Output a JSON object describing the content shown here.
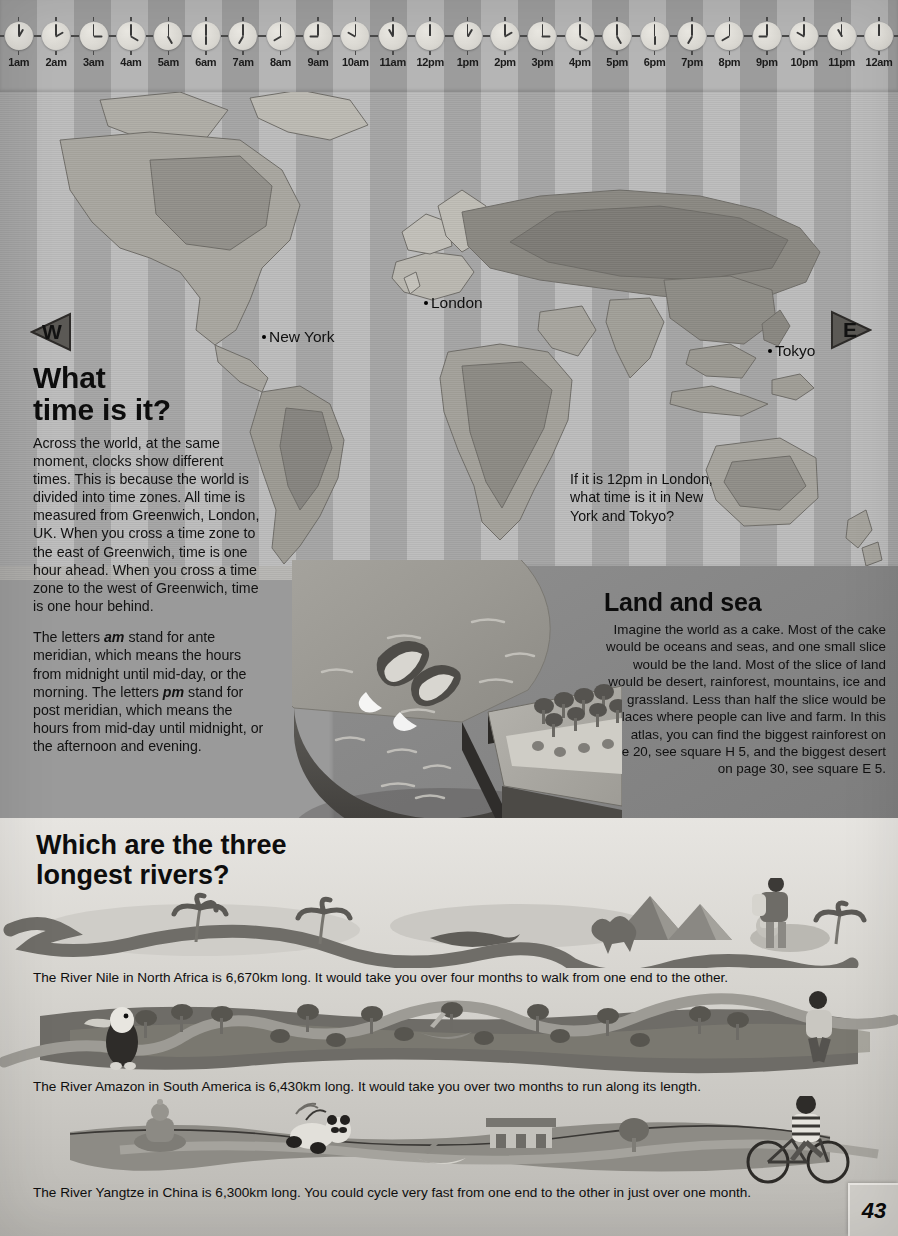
{
  "page": {
    "number": "43",
    "palette": {
      "stripe_light": "#bdbdbd",
      "stripe_dark": "#a6a6a6",
      "land_light": "#c9c7c0",
      "land_dark": "#8f8d87",
      "ink": "#111111",
      "panel_bg": "#8a8a8a",
      "rivers_bg": "#d7d5d0"
    }
  },
  "clock_strip": {
    "name": "time-zone-clock-strip",
    "clocks": [
      {
        "label": "1am",
        "hour": 1,
        "minute": 0
      },
      {
        "label": "2am",
        "hour": 2,
        "minute": 0
      },
      {
        "label": "3am",
        "hour": 3,
        "minute": 0
      },
      {
        "label": "4am",
        "hour": 4,
        "minute": 0
      },
      {
        "label": "5am",
        "hour": 5,
        "minute": 0
      },
      {
        "label": "6am",
        "hour": 6,
        "minute": 0
      },
      {
        "label": "7am",
        "hour": 7,
        "minute": 0
      },
      {
        "label": "8am",
        "hour": 8,
        "minute": 0
      },
      {
        "label": "9am",
        "hour": 9,
        "minute": 0
      },
      {
        "label": "10am",
        "hour": 10,
        "minute": 0
      },
      {
        "label": "11am",
        "hour": 11,
        "minute": 0
      },
      {
        "label": "12pm",
        "hour": 12,
        "minute": 0
      },
      {
        "label": "1pm",
        "hour": 1,
        "minute": 0
      },
      {
        "label": "2pm",
        "hour": 2,
        "minute": 0
      },
      {
        "label": "3pm",
        "hour": 3,
        "minute": 0
      },
      {
        "label": "4pm",
        "hour": 4,
        "minute": 0
      },
      {
        "label": "5pm",
        "hour": 5,
        "minute": 0
      },
      {
        "label": "6pm",
        "hour": 6,
        "minute": 0
      },
      {
        "label": "7pm",
        "hour": 7,
        "minute": 0
      },
      {
        "label": "8pm",
        "hour": 8,
        "minute": 0
      },
      {
        "label": "9pm",
        "hour": 9,
        "minute": 0
      },
      {
        "label": "10pm",
        "hour": 10,
        "minute": 0
      },
      {
        "label": "11pm",
        "hour": 11,
        "minute": 0
      },
      {
        "label": "12am",
        "hour": 12,
        "minute": 0
      }
    ]
  },
  "map": {
    "compass_west": "W",
    "compass_east": "E",
    "cities": [
      {
        "name": "London",
        "label": "London"
      },
      {
        "name": "New York",
        "label": "New York"
      },
      {
        "name": "Tokyo",
        "label": "Tokyo"
      }
    ]
  },
  "article": {
    "title_line1": "What",
    "title_line2": "time is it?",
    "paragraph1": "Across the world, at the same moment, clocks show different times. This is because the world is divided into time zones. All time is measured from Greenwich, London, UK. When you cross a time zone to the east of Greenwich, time is one hour ahead. When you cross a time zone to the west of Greenwich, time is one hour behind.",
    "paragraph2_part1": "The letters ",
    "paragraph2_em1": "am",
    "paragraph2_part2": " stand for ante meridian, which means the hours from midnight until mid-day, or the morning. The letters ",
    "paragraph2_em2": "pm",
    "paragraph2_part3": " stand for post meridian, which means the hours from mid-day until midnight, or the afternoon and evening."
  },
  "question_box": {
    "text": "If it is 12pm in London, what time is it in New York and Tokyo?"
  },
  "land_and_sea": {
    "title": "Land and sea",
    "body": "Imagine the world as a cake. Most of the cake would be oceans and seas, and one small slice would be the land. Most of the slice of land would be desert, rainforest, mountains, ice and grassland. Less than half the slice would be places where people can live and farm. In this atlas, you can find the biggest rainforest on page 20, see square H 5, and the biggest desert on page 30, see square E 5."
  },
  "rivers": {
    "title_line1": "Which are the three",
    "title_line2": "longest rivers?",
    "items": [
      {
        "name": "nile",
        "caption": "The River Nile in North Africa is 6,670km long. It would take you over four months to walk from one end to the other."
      },
      {
        "name": "amazon",
        "caption": "The River Amazon in South America is 6,430km long. It would take you over two months to run along its length."
      },
      {
        "name": "yangtze",
        "caption": "The River Yangtze in China is 6,300km long. You could cycle very fast from one end to the other in just over one month."
      }
    ]
  },
  "chart_data": {
    "type": "pie",
    "title": "Land and sea",
    "categories": [
      "Oceans and seas",
      "Land"
    ],
    "values": [
      71,
      29
    ],
    "unit": "percent of Earth's surface",
    "exploded_slice": "Land",
    "legend": "none"
  }
}
